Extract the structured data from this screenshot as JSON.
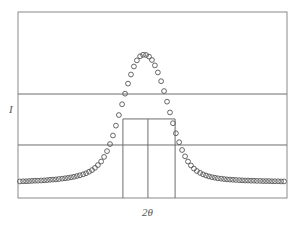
{
  "chart_data": {
    "type": "scatter",
    "title": "",
    "xlabel": "2θ",
    "ylabel": "I",
    "xlim": [
      0,
      100
    ],
    "ylim": [
      0,
      100
    ],
    "grid": false,
    "legend": null,
    "peak": {
      "center_x": 47.6,
      "max_intensity": 76.9,
      "baseline_intensity": 8.1,
      "half_max_intensity": 42.5,
      "fwhm_left_x": 39.0,
      "fwhm_right_x": 58.4
    },
    "reference_lines": {
      "horizontal": [
        55.9,
        28.5
      ],
      "vertical": [
        39.0,
        48.3,
        58.4
      ],
      "fwhm_box_top": 42.5
    },
    "series": [
      {
        "name": "measured",
        "marker": "open-circle",
        "x": [
          0.7,
          1.9,
          3.0,
          4.1,
          5.2,
          6.3,
          7.4,
          8.6,
          9.7,
          10.8,
          11.9,
          13.0,
          14.1,
          15.2,
          16.4,
          17.5,
          18.6,
          19.7,
          20.8,
          21.9,
          23.0,
          24.2,
          25.3,
          26.4,
          27.5,
          28.6,
          29.7,
          30.9,
          32.0,
          33.1,
          34.2,
          35.3,
          36.4,
          37.5,
          38.7,
          39.8,
          40.9,
          42.0,
          43.1,
          44.2,
          45.4,
          46.5,
          47.6,
          48.7,
          49.8,
          50.9,
          52.0,
          53.2,
          54.3,
          55.4,
          56.5,
          57.6,
          58.7,
          59.9,
          61.0,
          62.1,
          63.2,
          64.3,
          65.4,
          66.5,
          67.7,
          68.8,
          69.9,
          71.0,
          72.1,
          73.2,
          74.3,
          75.5,
          76.6,
          77.7,
          78.8,
          79.9,
          81.0,
          82.2,
          83.3,
          84.4,
          85.5,
          86.6,
          87.7,
          88.8,
          90.0,
          91.1,
          92.2,
          93.3,
          94.4,
          95.5,
          96.7,
          97.8,
          98.9
        ],
        "y": [
          8.9,
          9.0,
          9.0,
          9.1,
          9.2,
          9.3,
          9.3,
          9.4,
          9.5,
          9.6,
          9.8,
          9.9,
          10.0,
          10.2,
          10.4,
          10.6,
          10.8,
          11.1,
          11.4,
          11.8,
          12.2,
          12.7,
          13.3,
          14.1,
          15.0,
          16.2,
          17.7,
          19.6,
          22.1,
          25.2,
          29.0,
          33.6,
          38.9,
          44.6,
          50.4,
          56.1,
          61.5,
          66.4,
          70.7,
          74.0,
          76.2,
          77.0,
          76.9,
          76.0,
          74.2,
          71.3,
          67.5,
          62.8,
          57.5,
          51.8,
          46.0,
          40.2,
          34.8,
          30.0,
          25.8,
          22.4,
          19.6,
          17.5,
          15.8,
          14.5,
          13.5,
          12.7,
          12.1,
          11.6,
          11.2,
          10.9,
          10.6,
          10.4,
          10.2,
          10.0,
          9.9,
          9.8,
          9.7,
          9.6,
          9.5,
          9.4,
          9.4,
          9.3,
          9.3,
          9.2,
          9.2,
          9.1,
          9.1,
          9.1,
          9.0,
          9.0,
          9.0,
          8.9,
          8.9
        ]
      }
    ]
  },
  "axes": {
    "xlabel": "2θ",
    "ylabel": "I"
  }
}
